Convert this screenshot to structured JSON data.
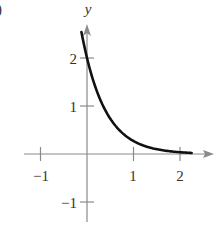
{
  "panel_marker": ")",
  "chart_data": {
    "type": "line",
    "title": "",
    "xlabel": "",
    "ylabel": "y",
    "function": "y = 2e^(-2x)",
    "x_ticks": [
      -1,
      1,
      2
    ],
    "y_ticks": [
      2,
      1,
      -1
    ],
    "x_tick_labels": [
      "−1",
      "1",
      "2"
    ],
    "y_tick_labels": [
      "2",
      "1",
      "−1"
    ],
    "xlim": [
      -1.6,
      2.7
    ],
    "ylim": [
      -1.5,
      2.6
    ],
    "grid": false,
    "legend": null,
    "series": [
      {
        "name": "curve",
        "x": [
          -0.12,
          0,
          0.25,
          0.5,
          0.75,
          1.0,
          1.25,
          1.5,
          1.75,
          2.0,
          2.25
        ],
        "values": [
          2.54,
          2.0,
          1.21,
          0.74,
          0.45,
          0.27,
          0.16,
          0.1,
          0.06,
          0.04,
          0.02
        ]
      }
    ],
    "colors": {
      "axis": "#8a8a8a",
      "curve": "#111111",
      "text": "#333333"
    }
  }
}
